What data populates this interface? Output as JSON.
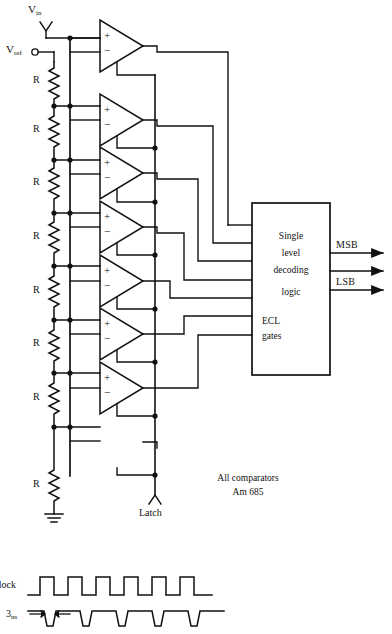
{
  "figure": {
    "type": "flash-adc-schematic",
    "title_text_present": false
  },
  "terminals": {
    "vin": {
      "label": "V",
      "sub": "in"
    },
    "vref": {
      "label": "V",
      "sub": "ref"
    },
    "latch": {
      "label": "Latch"
    }
  },
  "ladder": {
    "resistor_label": "R",
    "count": 8,
    "labels": [
      "R",
      "R",
      "R",
      "R",
      "R",
      "R",
      "R",
      "R"
    ],
    "ground": true
  },
  "comparators": {
    "count": 7,
    "plus_symbol": "+",
    "minus_symbol": "−",
    "note_line1": "All comparators",
    "note_line2": "Am 685"
  },
  "logic_block": {
    "line1": "Single",
    "line2": "level",
    "line3": "decoding",
    "line4": "logic",
    "line5": "ECL",
    "line6": "gates"
  },
  "outputs": {
    "msb": "MSB",
    "lsb": "LSB",
    "arrow_count": 3
  },
  "waveforms": {
    "clock_label": "Clock",
    "pulse_label": "3",
    "pulse_label_sub": "ns",
    "clock_cycles": 6,
    "pulse_count": 6
  },
  "colors": {
    "ink": "#111111",
    "background": "#ffffff"
  }
}
